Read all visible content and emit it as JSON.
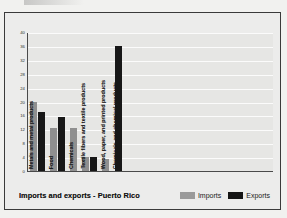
{
  "chart_data": {
    "type": "bar",
    "title": "Imports and exports - Puerto Rico",
    "xlabel": "",
    "ylabel": "",
    "ylim": [
      0,
      40
    ],
    "yticks": [
      0,
      4,
      8,
      12,
      16,
      20,
      24,
      28,
      32,
      36,
      40
    ],
    "grid": true,
    "legend_position": "bottom-right",
    "categories": [
      "Metals and metal products",
      "Food",
      "Chemicals",
      "Textile fibers and textile products",
      "Wood, paper, and printed products",
      "Chemicals and chemical products"
    ],
    "series": [
      {
        "name": "Imports",
        "color": "#8f8f8f",
        "values": [
          20,
          12.5,
          12.5,
          4,
          3.5,
          0
        ]
      },
      {
        "name": "Exports",
        "color": "#171717",
        "values": [
          17,
          15.5,
          0,
          4,
          0,
          36
        ]
      }
    ]
  },
  "legend": {
    "items": [
      {
        "label": "Imports",
        "swatch": "imports"
      },
      {
        "label": "Exports",
        "swatch": "exports"
      }
    ]
  }
}
